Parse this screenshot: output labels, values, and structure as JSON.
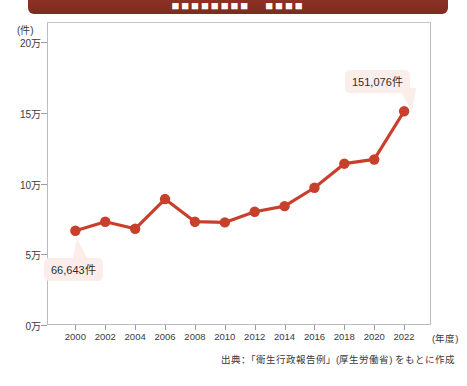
{
  "banner": {
    "title": "■■■■■■■■　■■■■",
    "color": "#8b3024"
  },
  "source": {
    "note": "出典：「衛生行政報告例」(厚生労働省) をもとに作成"
  },
  "chart_data": {
    "type": "line",
    "title": "",
    "xlabel": "(年度)",
    "ylabel": "(件)",
    "unit_label": "(件)",
    "x_axis_unit": "(年度)",
    "categories": [
      "2000",
      "2002",
      "2004",
      "2006",
      "2008",
      "2010",
      "2012",
      "2014",
      "2016",
      "2018",
      "2020",
      "2022"
    ],
    "values": [
      66643,
      73000,
      68000,
      89000,
      73000,
      72500,
      80000,
      84000,
      97000,
      114000,
      117000,
      151076
    ],
    "y_tick_labels": [
      "20万",
      "15万",
      "10万",
      "5万",
      "0万"
    ],
    "y_tick_values": [
      200000,
      150000,
      100000,
      50000,
      0
    ],
    "ylim": [
      0,
      200000
    ],
    "grid": false,
    "legend": "none",
    "series_color": "#c8402c",
    "marker_color": "#c8402c",
    "annotations": [
      {
        "label": "66,643件",
        "category": "2000",
        "value": 66643
      },
      {
        "label": "151,076件",
        "category": "2022",
        "value": 151076
      }
    ]
  }
}
